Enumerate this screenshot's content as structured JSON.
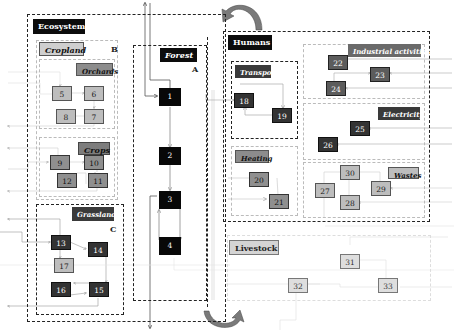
{
  "diagram": {
    "sections": {
      "ecosystems": {
        "label": "Ecosystems"
      },
      "humans": {
        "label": "Humans"
      },
      "forest": {
        "label": "Forest",
        "letter": "A"
      },
      "cropland": {
        "label": "Cropland",
        "letter": "B"
      },
      "orchards": {
        "label": "Orchards"
      },
      "crops": {
        "label": "Crops"
      },
      "grassland": {
        "label": "Grassland",
        "letter": "C"
      },
      "transport": {
        "label": "Transport"
      },
      "heating": {
        "label": "Heating"
      },
      "industrial": {
        "label": "Industrial activities"
      },
      "electricity": {
        "label": "Electricity"
      },
      "wastes": {
        "label": "Wastes"
      },
      "livestock": {
        "label": "Livestock"
      }
    },
    "nodes": {
      "n1": "1",
      "n2": "2",
      "n3": "3",
      "n4": "4",
      "n5": "5",
      "n6": "6",
      "n7": "7",
      "n8": "8",
      "n9": "9",
      "n10": "10",
      "n11": "11",
      "n12": "12",
      "n13": "13",
      "n14": "14",
      "n15": "15",
      "n16": "16",
      "n17": "17",
      "n18": "18",
      "n19": "19",
      "n20": "20",
      "n21": "21",
      "n22": "22",
      "n23": "23",
      "n24": "24",
      "n25": "25",
      "n26": "26",
      "n27": "27",
      "n28": "28",
      "n29": "29",
      "n30": "30",
      "n31": "31",
      "n32": "32",
      "n33": "33"
    },
    "colors": {
      "black": "#080808",
      "dark": "#333333",
      "mid": "#5c5c5c",
      "gray": "#8f8f8f",
      "light": "#bdbdbd",
      "pale": "#dedede",
      "curved_arrow": "#7a7a7a"
    }
  }
}
